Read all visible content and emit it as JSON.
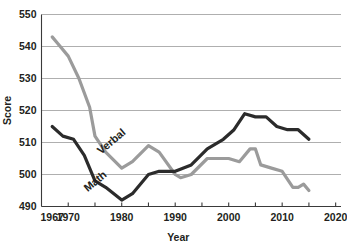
{
  "chart_data": {
    "type": "line",
    "title": "",
    "xlabel": "Year",
    "ylabel": "Score",
    "xlim": [
      1965,
      2021
    ],
    "ylim": [
      490,
      550
    ],
    "grid": true,
    "grid_axis": "y",
    "legend": "inline-labels",
    "legend_position": "on-curve",
    "x_ticks_labeled": [
      "1967",
      "1970",
      "1980",
      "1990",
      "2000",
      "2010",
      "2020"
    ],
    "x_tick_values_labeled": [
      1967,
      1970,
      1980,
      1990,
      2000,
      2010,
      2020
    ],
    "x_minor_ticks": [
      1970,
      1975,
      1980,
      1985,
      1990,
      1995,
      2000,
      2005,
      2010,
      2015,
      2020
    ],
    "y_ticks": [
      "490",
      "500",
      "510",
      "520",
      "530",
      "540",
      "550"
    ],
    "y_tick_values": [
      490,
      500,
      510,
      520,
      530,
      540,
      550
    ],
    "series": [
      {
        "name": "Verbal",
        "color": "#9b9b9b",
        "label_text": "Verbal",
        "x": [
          1967,
          1968,
          1970,
          1972,
          1974,
          1975,
          1977,
          1980,
          1982,
          1985,
          1987,
          1990,
          1991,
          1993,
          1996,
          2000,
          2002,
          2004,
          2005,
          2006,
          2008,
          2010,
          2012,
          2013,
          2014,
          2015
        ],
        "values": [
          543,
          541,
          537,
          530,
          521,
          512,
          507,
          502,
          504,
          509,
          507,
          500,
          499,
          500,
          505,
          505,
          504,
          508,
          508,
          503,
          502,
          501,
          496,
          496,
          497,
          495
        ]
      },
      {
        "name": "Math",
        "color": "#2b2b2b",
        "label_text": "Math",
        "x": [
          1967,
          1969,
          1971,
          1973,
          1975,
          1977,
          1980,
          1982,
          1985,
          1987,
          1990,
          1993,
          1996,
          1999,
          2001,
          2003,
          2005,
          2007,
          2009,
          2011,
          2013,
          2015
        ],
        "values": [
          515,
          512,
          511,
          506,
          498,
          496,
          492,
          494,
          500,
          501,
          501,
          503,
          508,
          511,
          514,
          519,
          518,
          518,
          515,
          514,
          514,
          511
        ]
      }
    ],
    "series_labels_placement": [
      {
        "name": "Verbal",
        "x_year": 1978.5,
        "y_score": 509.5,
        "rotation": -40
      },
      {
        "name": "Math",
        "x_year": 1975.5,
        "y_score": 497.0,
        "rotation": -40
      }
    ]
  },
  "axes": {
    "y_axis_title": "Score",
    "x_axis_title": "Year"
  }
}
